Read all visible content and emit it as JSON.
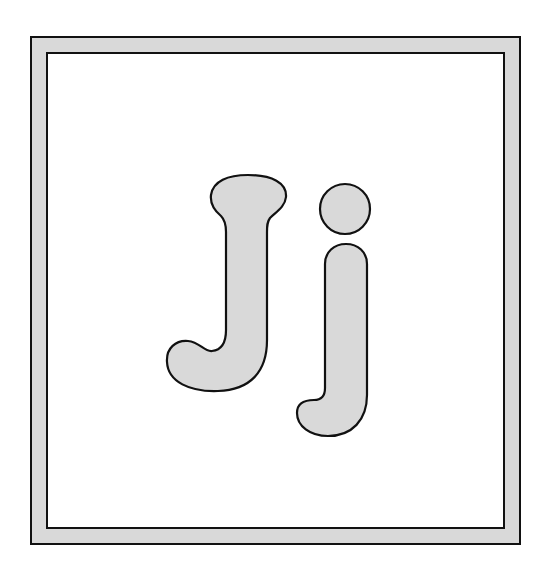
{
  "card": {
    "letters": "Jj",
    "uppercase": "J",
    "lowercase": "j",
    "fill_color": "#d9d9d9",
    "outline_color": "#111111",
    "border_color": "#d9d9d9",
    "background_color": "#ffffff"
  }
}
